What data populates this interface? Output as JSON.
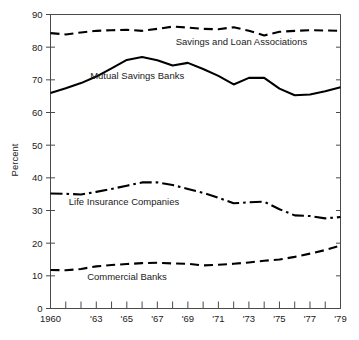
{
  "chart_data": {
    "type": "line",
    "title": "",
    "xlabel": "",
    "ylabel": "Percent",
    "ylim": [
      0,
      90
    ],
    "xlim": [
      1960,
      1979
    ],
    "grid": false,
    "legend_position": "inline-annotations",
    "y_ticks": [
      "0",
      "10",
      "20",
      "30",
      "40",
      "50",
      "60",
      "70",
      "80",
      "90"
    ],
    "y_tick_values": [
      0,
      10,
      20,
      30,
      40,
      50,
      60,
      70,
      80,
      90
    ],
    "x": [
      1960,
      1961,
      1962,
      1963,
      1964,
      1965,
      1966,
      1967,
      1968,
      1969,
      1970,
      1971,
      1972,
      1973,
      1974,
      1975,
      1976,
      1977,
      1978,
      1979
    ],
    "x_tick_values": [
      1960,
      1961,
      1962,
      1963,
      1964,
      1965,
      1966,
      1967,
      1968,
      1969,
      1970,
      1971,
      1972,
      1973,
      1974,
      1975,
      1976,
      1977,
      1978,
      1979
    ],
    "x_tick_labels": [
      "1960",
      "",
      "",
      "'63",
      "",
      "'65",
      "",
      "'67",
      "",
      "'69",
      "",
      "'71",
      "",
      "'73",
      "",
      "'75",
      "",
      "'77",
      "",
      "'79"
    ],
    "series": [
      {
        "name": "Savings and Loan Associations",
        "style": "dashed",
        "label_x": 1968.2,
        "label_y": 80.6,
        "values": [
          84.3,
          83.9,
          84.5,
          85.0,
          85.2,
          85.3,
          85.0,
          85.6,
          86.3,
          86.0,
          85.6,
          85.5,
          86.1,
          85.0,
          83.6,
          84.7,
          85.0,
          85.2,
          85.1,
          85.0
        ]
      },
      {
        "name": "Mutual Savings Banks",
        "style": "solid",
        "label_x": 1962.6,
        "label_y": 70.2,
        "values": [
          66.0,
          67.4,
          69.0,
          71.0,
          73.5,
          76.1,
          77.0,
          76.0,
          74.4,
          75.2,
          73.3,
          71.2,
          68.6,
          70.6,
          70.6,
          67.3,
          65.3,
          65.5,
          66.5,
          67.7
        ]
      },
      {
        "name": "Life Insurance Companies",
        "style": "dash-dot",
        "label_x": 1961.2,
        "label_y": 31.8,
        "values": [
          35.2,
          35.1,
          34.9,
          35.7,
          36.6,
          37.6,
          38.6,
          38.6,
          37.8,
          36.6,
          35.4,
          33.9,
          32.2,
          32.5,
          32.7,
          30.4,
          28.5,
          28.3,
          27.6,
          28.0
        ]
      },
      {
        "name": "Commercial Banks",
        "style": "dashed",
        "label_x": 1962.4,
        "label_y": 8.7,
        "values": [
          11.8,
          11.7,
          12.1,
          12.9,
          13.3,
          13.6,
          13.9,
          14.0,
          13.8,
          13.7,
          13.2,
          13.4,
          13.7,
          14.1,
          14.6,
          15.0,
          15.8,
          16.8,
          17.9,
          19.3
        ]
      }
    ]
  }
}
